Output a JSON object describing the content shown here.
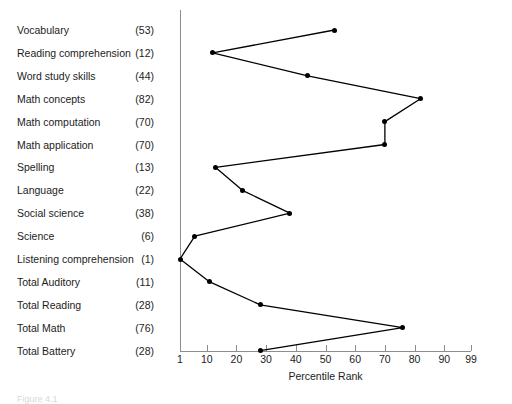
{
  "chart_data": {
    "type": "line",
    "title": "",
    "xlabel": "Percentile Rank",
    "ylabel": "",
    "orientation": "horizontal",
    "xlim": [
      1,
      99
    ],
    "xticks": [
      1,
      10,
      20,
      30,
      40,
      50,
      60,
      70,
      80,
      90,
      99
    ],
    "xtick_labels": [
      "1",
      "10",
      "20",
      "30",
      "40",
      "50",
      "60",
      "70",
      "80",
      "90",
      "99"
    ],
    "grid": false,
    "legend": "none",
    "categories": [
      "Vocabulary",
      "Reading comprehension",
      "Word study skills",
      "Math concepts",
      "Math computation",
      "Math application",
      "Spelling",
      "Language",
      "Social science",
      "Science",
      "Listening comprehension",
      "Total Auditory",
      "Total Reading",
      "Total Math",
      "Total Battery"
    ],
    "score_labels": [
      "(53)",
      "(12)",
      "(44)",
      "(82)",
      "(70)",
      "(70)",
      "(13)",
      "(22)",
      "(38)",
      "(6)",
      "(1)",
      "(11)",
      "(28)",
      "(76)",
      "(28)"
    ],
    "values": [
      53,
      12,
      44,
      82,
      70,
      70,
      13,
      22,
      38,
      6,
      1,
      11,
      28,
      76,
      28
    ]
  },
  "caption": "Figure 4.1",
  "colors": {
    "line": "#000000",
    "marker": "#000000",
    "axis": "#8d8d8d",
    "text": "#1c1c1c",
    "background": "#ffffff"
  }
}
